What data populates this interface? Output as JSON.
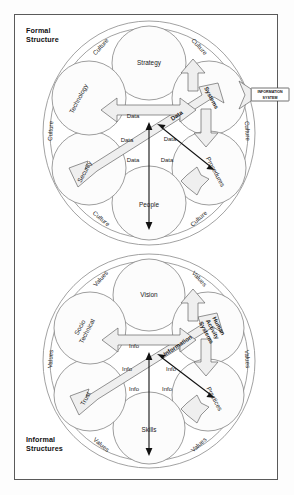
{
  "figure": {
    "panels": [
      {
        "id": "formal",
        "title": "Formal\nStructure",
        "center_system_label": "INFORMATION\nSYSTEM",
        "petals": [
          {
            "name": "Strategy",
            "label": "Strategy",
            "rotation": 0
          },
          {
            "name": "Systems",
            "label": "Systems",
            "rotation": 62,
            "bold": true
          },
          {
            "name": "Procedures",
            "label": "Procedures",
            "rotation": 62
          },
          {
            "name": "People",
            "label": "People",
            "rotation": 0
          },
          {
            "name": "Security",
            "label": "Security",
            "rotation": -62
          },
          {
            "name": "Technology",
            "label": "Technology",
            "rotation": -62
          }
        ],
        "ring_labels": [
          {
            "label": "Culture",
            "rotation": -48
          },
          {
            "label": "Culture",
            "rotation": 48
          },
          {
            "label": "Culture",
            "rotation": 86
          },
          {
            "label": "Culture",
            "rotation": -42
          },
          {
            "label": "Culture",
            "rotation": 40
          },
          {
            "label": "Culture",
            "rotation": -86
          }
        ],
        "flow_labels": [
          {
            "label": "Data",
            "rotation": 0
          },
          {
            "label": "Data",
            "rotation": -34,
            "bold": true
          },
          {
            "label": "Data",
            "rotation": 0
          },
          {
            "label": "Data",
            "rotation": 0
          },
          {
            "label": "Data",
            "rotation": 0
          },
          {
            "label": "Data",
            "rotation": 0
          }
        ]
      },
      {
        "id": "informal",
        "title": "Informal\nStructures",
        "center_system_label": "",
        "petals": [
          {
            "name": "Vision",
            "label": "Vision",
            "rotation": 0
          },
          {
            "name": "HumanActivitySystems",
            "label": "Human\nActivity\nSystems",
            "rotation": 62,
            "bold": true
          },
          {
            "name": "Practices",
            "label": "Practices",
            "rotation": 62
          },
          {
            "name": "Skills",
            "label": "Skills",
            "rotation": 0
          },
          {
            "name": "Trust",
            "label": "Trust",
            "rotation": -62
          },
          {
            "name": "SocioTechnical",
            "label": "Socio\nTechnical",
            "rotation": -62
          }
        ],
        "ring_labels": [
          {
            "label": "Values",
            "rotation": -48
          },
          {
            "label": "Values",
            "rotation": 48
          },
          {
            "label": "Values",
            "rotation": 86
          },
          {
            "label": "Values",
            "rotation": -42
          },
          {
            "label": "Values",
            "rotation": 40
          },
          {
            "label": "Values",
            "rotation": -86
          }
        ],
        "flow_labels": [
          {
            "label": "Info",
            "rotation": 0
          },
          {
            "label": "Information",
            "rotation": -34,
            "bold": true
          },
          {
            "label": "Info",
            "rotation": 0
          },
          {
            "label": "Info",
            "rotation": 0
          },
          {
            "label": "Info",
            "rotation": 0
          },
          {
            "label": "Info",
            "rotation": 0
          }
        ]
      }
    ]
  }
}
